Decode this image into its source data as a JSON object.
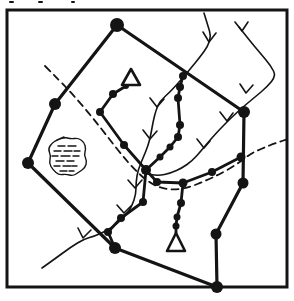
{
  "figure": {
    "canvas": {
      "width": 294,
      "height": 301,
      "background": "#ffffff",
      "ink": "#141414"
    },
    "frame": {
      "x": 7,
      "y": 10,
      "width": 280,
      "height": 277,
      "stroke_width": 3
    },
    "boundary": {
      "stroke_width": 3.2,
      "closed": true,
      "points": [
        [
          117,
          25
        ],
        [
          244,
          112
        ],
        [
          243,
          183
        ],
        [
          216,
          234
        ],
        [
          217,
          287
        ],
        [
          115,
          248
        ],
        [
          28,
          163
        ],
        [
          55,
          104
        ]
      ],
      "vertex_dots": [
        [
          117,
          25,
          7
        ],
        [
          244,
          112,
          6
        ],
        [
          243,
          183,
          5.5
        ],
        [
          216,
          234,
          5.5
        ],
        [
          217,
          287,
          6
        ],
        [
          115,
          248,
          6
        ],
        [
          28,
          163,
          6
        ],
        [
          55,
          104,
          6
        ]
      ]
    },
    "node_paths": [
      {
        "name": "path-northwest",
        "points": [
          [
            126,
            86
          ],
          [
            113,
            94
          ],
          [
            100,
            112
          ],
          [
            124,
            145
          ],
          [
            146,
            170
          ]
        ],
        "dots": [
          [
            126,
            86,
            3
          ],
          [
            113,
            94,
            4
          ],
          [
            100,
            112,
            4
          ],
          [
            124,
            145,
            4
          ]
        ]
      },
      {
        "name": "path-central",
        "points": [
          [
            183,
            76
          ],
          [
            180,
            87
          ],
          [
            178,
            98
          ],
          [
            180,
            125
          ],
          [
            178,
            137
          ],
          [
            170,
            147
          ],
          [
            160,
            157
          ],
          [
            146,
            170
          ]
        ],
        "dots": [
          [
            183,
            76,
            4
          ],
          [
            180,
            87,
            4
          ],
          [
            178,
            98,
            4
          ],
          [
            180,
            125,
            4
          ],
          [
            178,
            137,
            4
          ],
          [
            170,
            147,
            3.5
          ],
          [
            160,
            157,
            3.5
          ],
          [
            146,
            170,
            5
          ]
        ]
      },
      {
        "name": "path-east",
        "points": [
          [
            146,
            170
          ],
          [
            157,
            182
          ],
          [
            183,
            183
          ],
          [
            212,
            172
          ],
          [
            241,
            157
          ]
        ],
        "dots": [
          [
            157,
            182,
            4
          ],
          [
            183,
            183,
            4.5
          ],
          [
            212,
            172,
            4
          ],
          [
            241,
            157,
            4.5
          ]
        ]
      },
      {
        "name": "path-south",
        "points": [
          [
            183,
            183
          ],
          [
            181,
            203
          ],
          [
            177,
            217
          ],
          [
            176,
            226
          ],
          [
            176,
            233
          ]
        ],
        "dots": [
          [
            181,
            203,
            4
          ],
          [
            177,
            217,
            3.5
          ],
          [
            176,
            226,
            3.5
          ]
        ]
      },
      {
        "name": "path-southwest",
        "points": [
          [
            146,
            170
          ],
          [
            143,
            202
          ],
          [
            121,
            218
          ],
          [
            108,
            232
          ],
          [
            115,
            248
          ]
        ],
        "dots": [
          [
            143,
            202,
            4
          ],
          [
            121,
            218,
            4
          ],
          [
            108,
            232,
            4
          ]
        ]
      }
    ],
    "triangles": [
      {
        "name": "triangle-north",
        "points": [
          [
            131,
            69
          ],
          [
            122,
            85
          ],
          [
            140,
            85
          ]
        ],
        "stroke_width": 2.6
      },
      {
        "name": "triangle-south",
        "points": [
          [
            176,
            233
          ],
          [
            167,
            251
          ],
          [
            185,
            251
          ]
        ],
        "stroke_width": 2.6
      }
    ],
    "streams": [
      {
        "name": "stream-main",
        "stroke_width": 1.6,
        "points": [
          [
            204,
            13
          ],
          [
            208,
            26
          ],
          [
            211,
            36
          ],
          [
            208,
            46
          ],
          [
            200,
            57
          ],
          [
            191,
            68
          ],
          [
            181,
            80
          ],
          [
            170,
            92
          ],
          [
            160,
            101
          ],
          [
            156,
            110
          ],
          [
            153,
            122
          ],
          [
            151,
            134
          ],
          [
            148,
            146
          ],
          [
            143,
            158
          ],
          [
            138,
            170
          ],
          [
            136,
            182
          ],
          [
            136,
            194
          ],
          [
            132,
            206
          ],
          [
            126,
            215
          ],
          [
            117,
            224
          ],
          [
            106,
            231
          ],
          [
            95,
            236
          ],
          [
            84,
            239
          ],
          [
            71,
            247
          ],
          [
            56,
            258
          ],
          [
            42,
            268
          ]
        ],
        "ticks": [
          {
            "v": [
              209,
              42
            ],
            "a": [
              203,
              32
            ],
            "b": [
              216,
              33
            ]
          },
          {
            "v": [
              157,
              107
            ],
            "a": [
              150,
              98
            ],
            "b": [
              164,
              99
            ]
          },
          {
            "v": [
              150,
              139
            ],
            "a": [
              143,
              130
            ],
            "b": [
              157,
              131
            ]
          },
          {
            "v": [
              135,
              188
            ],
            "a": [
              128,
              180
            ],
            "b": [
              142,
              180
            ]
          },
          {
            "v": [
              124,
              213
            ],
            "a": [
              117,
              205
            ],
            "b": [
              131,
              206
            ]
          },
          {
            "v": [
              83,
              238
            ],
            "a": [
              78,
              228
            ],
            "b": [
              91,
              230
            ]
          }
        ]
      },
      {
        "name": "stream-east",
        "stroke_width": 1.6,
        "points": [
          [
            239,
            27
          ],
          [
            250,
            41
          ],
          [
            261,
            54
          ],
          [
            271,
            66
          ],
          [
            276,
            76
          ],
          [
            267,
            87
          ],
          [
            255,
            97
          ],
          [
            243,
            107
          ],
          [
            232,
            117
          ],
          [
            221,
            128
          ],
          [
            210,
            140
          ],
          [
            201,
            151
          ],
          [
            192,
            161
          ],
          [
            182,
            168
          ],
          [
            171,
            173
          ],
          [
            158,
            176
          ],
          [
            143,
            173
          ]
        ],
        "ticks": [
          {
            "v": [
              242,
              31
            ],
            "a": [
              235,
              22
            ],
            "b": [
              248,
              22
            ]
          },
          {
            "v": [
              246,
              93
            ],
            "a": [
              240,
              84
            ],
            "b": [
              253,
              85
            ]
          },
          {
            "v": [
              227,
              121
            ],
            "a": [
              220,
              112
            ],
            "b": [
              233,
              113
            ]
          },
          {
            "v": [
              204,
              148
            ],
            "a": [
              197,
              139
            ],
            "b": [
              210,
              141
            ]
          }
        ]
      }
    ],
    "roads": [
      {
        "name": "dashed-road",
        "stroke_width": 1.8,
        "dash": "7 5",
        "points": [
          [
            45,
            66
          ],
          [
            60,
            81
          ],
          [
            76,
            98
          ],
          [
            92,
            117
          ],
          [
            107,
            136
          ],
          [
            121,
            154
          ],
          [
            134,
            169
          ],
          [
            147,
            181
          ],
          [
            160,
            188
          ],
          [
            175,
            190
          ],
          [
            190,
            187
          ],
          [
            205,
            181
          ],
          [
            220,
            174
          ],
          [
            236,
            165
          ],
          [
            250,
            154
          ],
          [
            263,
            148
          ],
          [
            276,
            143
          ],
          [
            288,
            139
          ]
        ]
      }
    ],
    "marsh": {
      "name": "marsh-symbol",
      "stroke_width": 1.4,
      "outline": [
        [
          57,
          140
        ],
        [
          64,
          137
        ],
        [
          71,
          139
        ],
        [
          78,
          138
        ],
        [
          84,
          142
        ],
        [
          86,
          149
        ],
        [
          84,
          155
        ],
        [
          87,
          161
        ],
        [
          85,
          168
        ],
        [
          79,
          172
        ],
        [
          73,
          176
        ],
        [
          66,
          174
        ],
        [
          59,
          175
        ],
        [
          53,
          170
        ],
        [
          49,
          163
        ],
        [
          51,
          156
        ],
        [
          48,
          149
        ],
        [
          52,
          143
        ]
      ],
      "dashes": [
        [
          58,
          146,
          7
        ],
        [
          68,
          146,
          8
        ],
        [
          54,
          151,
          7
        ],
        [
          64,
          151,
          8
        ],
        [
          74,
          151,
          6
        ],
        [
          52,
          156,
          6
        ],
        [
          61,
          156,
          9
        ],
        [
          73,
          156,
          6
        ],
        [
          56,
          161,
          8
        ],
        [
          67,
          161,
          7
        ],
        [
          54,
          166,
          6
        ],
        [
          63,
          166,
          8
        ],
        [
          72,
          166,
          5
        ],
        [
          60,
          171,
          7
        ],
        [
          69,
          171,
          5
        ]
      ]
    },
    "specks": [
      [
        9,
        1,
        5,
        2
      ],
      [
        38,
        1,
        5,
        2
      ],
      [
        71,
        1,
        4,
        2
      ]
    ]
  }
}
